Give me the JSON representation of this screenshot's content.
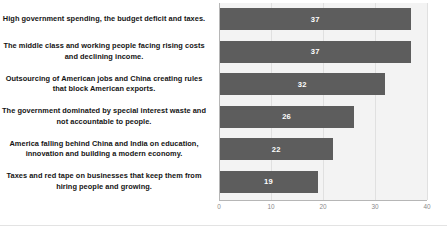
{
  "chart_data": {
    "type": "bar",
    "orientation": "horizontal",
    "title": "",
    "xlabel": "",
    "ylabel": "",
    "xlim": [
      0,
      40
    ],
    "xticks": [
      "0",
      "10",
      "20",
      "30",
      "40"
    ],
    "grid": true,
    "legend": false,
    "bar_color": "#5d5d5d",
    "plot_background": "#f3f3f3",
    "value_label_color": "#ffffff",
    "categories": [
      "High government spending, the budget deficit and taxes.",
      "The middle class and working people facing rising costs and declining income.",
      "Outsourcing of American jobs and China creating rules that block American exports.",
      "The government dominated by special interest waste and not accountable to people.",
      "America falling behind China and India on education, innovation and building a modern economy.",
      "Taxes and red tape on businesses that keep them from hiring people and growing."
    ],
    "values": [
      37,
      37,
      32,
      26,
      22,
      19
    ],
    "value_labels": [
      "37",
      "37",
      "32",
      "26",
      "22",
      "19"
    ]
  }
}
